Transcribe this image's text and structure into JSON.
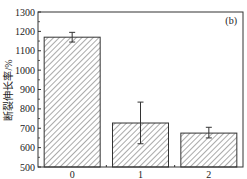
{
  "chart_data": {
    "type": "bar",
    "title": "",
    "panel_label": "(b)",
    "xlabel": "",
    "ylabel": "断裂伸长率/%",
    "categories": [
      "0",
      "1",
      "2"
    ],
    "values": [
      1170,
      727,
      675
    ],
    "error_bars": [
      {
        "lower": 1145,
        "upper": 1195
      },
      {
        "lower": 620,
        "upper": 835
      },
      {
        "lower": 650,
        "upper": 705
      }
    ],
    "ylim": [
      500,
      1300
    ],
    "yticks": [
      500,
      600,
      700,
      800,
      900,
      1000,
      1100,
      1200,
      1300
    ],
    "grid": false,
    "legend": null,
    "bar_fill": "diagonal-hatch",
    "colors": {
      "bar_edge": "#333333",
      "hatch": "#555555",
      "axis": "#333333"
    }
  }
}
